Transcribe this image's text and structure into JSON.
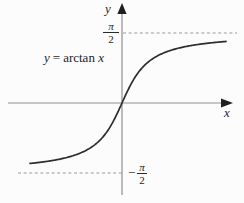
{
  "chart_data": {
    "type": "line",
    "function": "y = arctan(x)",
    "xlabel": "x",
    "ylabel": "y",
    "x_range": [
      -4.6,
      5.2
    ],
    "y_range": [
      -1.5708,
      1.5708
    ],
    "grid": false,
    "legend": false,
    "asymptotes": {
      "upper": 1.5708,
      "lower": -1.5708,
      "upper_label": "π/2",
      "lower_label": "−π/2",
      "style": "dashed"
    },
    "x": [
      -4.6,
      -4,
      -3,
      -2,
      -1.5,
      -1,
      -0.5,
      0,
      0.5,
      1,
      1.5,
      2,
      3,
      4,
      5.2
    ],
    "y": [
      -1.357,
      -1.326,
      -1.249,
      -1.107,
      -0.983,
      -0.785,
      -0.464,
      0,
      0.464,
      0.785,
      0.983,
      1.107,
      1.249,
      1.326,
      1.381
    ]
  },
  "figure": {
    "colors": {
      "background": "#fcfcfc",
      "curve": "#2e2e2e",
      "axis": "#8f8f8f",
      "arrow": "#1f1f1f",
      "dash": "#9a9a9a",
      "text": "#1f1f1f"
    },
    "axes": {
      "x": "x",
      "y": "y"
    },
    "equation": {
      "lhs": "y",
      "equals": "=",
      "func": "arctan",
      "var": "x"
    },
    "labels": {
      "upper": {
        "numerator": "π",
        "denominator": "2"
      },
      "lower": {
        "minus": "−",
        "numerator": "π",
        "denominator": "2"
      }
    }
  }
}
